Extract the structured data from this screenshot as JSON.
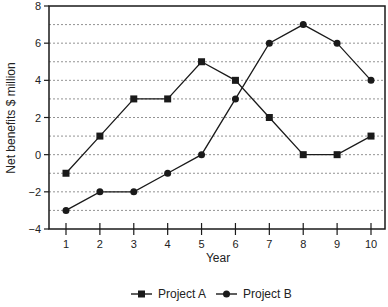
{
  "chart_data": {
    "type": "line",
    "title": "",
    "xlabel": "Year",
    "ylabel": "Net benefits $ million",
    "x": [
      1,
      2,
      3,
      4,
      5,
      6,
      7,
      8,
      9,
      10
    ],
    "ylim": [
      -4,
      8
    ],
    "yticks": [
      -4,
      -2,
      0,
      2,
      4,
      6,
      8
    ],
    "grid": "horizontal dotted at every 1 unit",
    "legend_position": "bottom",
    "series": [
      {
        "name": "Project A",
        "marker": "square",
        "values": [
          -1,
          1,
          3,
          3,
          5,
          4,
          2,
          0,
          0,
          1
        ]
      },
      {
        "name": "Project B",
        "marker": "circle",
        "values": [
          -3,
          -2,
          -2,
          -1,
          0,
          3,
          6,
          7,
          6,
          4
        ]
      }
    ]
  },
  "colors": {
    "line": "#1a1a1a",
    "grid": "#777777",
    "axis": "#1a1a1a"
  }
}
